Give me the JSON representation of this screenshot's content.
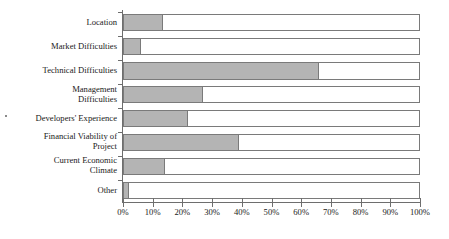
{
  "chart_data": {
    "type": "bar",
    "orientation": "horizontal",
    "stacked": true,
    "title": "",
    "subtitle": "",
    "xlabel": "",
    "ylabel": "",
    "xlim": [
      0,
      100
    ],
    "grid": false,
    "legend": null,
    "categories": [
      "Location",
      "Market Difficulties",
      "Technical Difficulties",
      "Management\nDifficulties",
      "Developers' Experience",
      "Financial Viability of\nProject",
      "Current Economic\nClimate",
      "Other"
    ],
    "values": [
      13.5,
      6,
      66,
      27,
      22,
      39,
      14,
      2
    ],
    "series": [
      {
        "name": "Shaded",
        "color": "#b4b4b4",
        "values": [
          13.5,
          6,
          66,
          27,
          22,
          39,
          14,
          2
        ]
      },
      {
        "name": "Remainder",
        "color": "#ffffff",
        "values": [
          86.5,
          94,
          34,
          73,
          78,
          61,
          86,
          98
        ]
      }
    ],
    "xticks": [
      0,
      10,
      20,
      30,
      40,
      50,
      60,
      70,
      80,
      90,
      100
    ],
    "xticklabels": [
      "0%",
      "10%",
      "20%",
      "30%",
      "40%",
      "50%",
      "60%",
      "70%",
      "80%",
      "90%",
      "100%"
    ]
  },
  "colors": {
    "bar_fill": "#b4b4b4",
    "bar_border": "#7a7a7a",
    "axis": "#6e6e6e",
    "text": "#1a1a1a",
    "background": "#ffffff"
  }
}
